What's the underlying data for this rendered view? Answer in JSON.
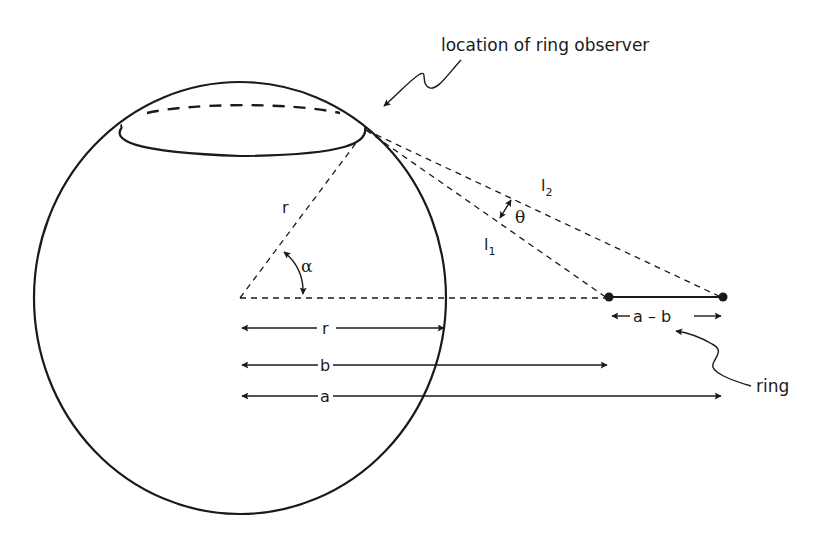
{
  "diagram": {
    "type": "geometry",
    "annotations": {
      "observer_label": "location of ring observer",
      "ring_label": "ring"
    },
    "angle_labels": {
      "alpha": "α",
      "theta": "θ"
    },
    "line_labels": {
      "radius": "r",
      "l1_main": "l",
      "l1_sub": "1",
      "l2_main": "l",
      "l2_sub": "2"
    },
    "dimensions": [
      {
        "label": "r",
        "from": "center",
        "to": "sphere edge"
      },
      {
        "label": "b",
        "from": "center",
        "to": "ring inner edge"
      },
      {
        "label": "a",
        "from": "center",
        "to": "ring outer edge"
      },
      {
        "label": "a – b",
        "from": "ring inner edge",
        "to": "ring outer edge"
      }
    ],
    "colors": {
      "ink": "#1a1a1a",
      "background": "#ffffff"
    }
  }
}
